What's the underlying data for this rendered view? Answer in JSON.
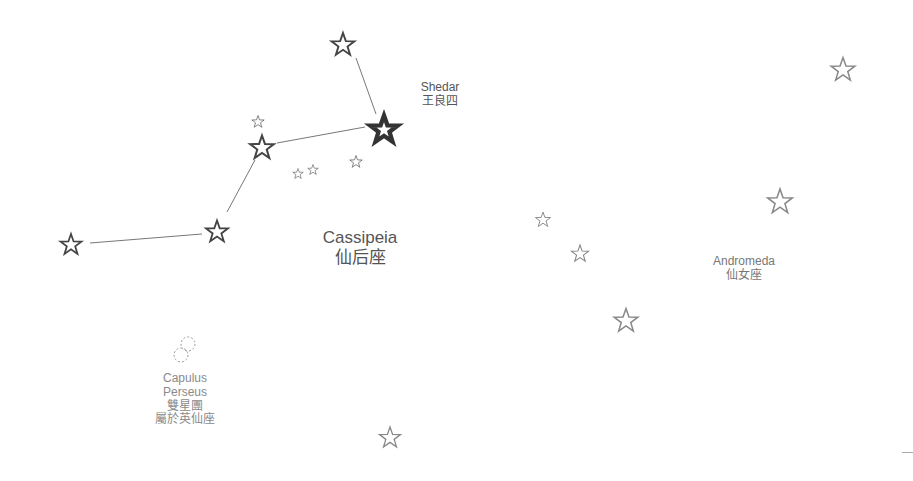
{
  "constellations": {
    "cassiopeia": {
      "name_en": "Cassipeia",
      "name_zh": "仙后座"
    },
    "andromeda": {
      "name_en": "Andromeda",
      "name_zh": "仙女座"
    }
  },
  "stars": {
    "shedar": {
      "name_en": "Shedar",
      "name_zh": "王良四"
    }
  },
  "clusters": {
    "capulus": {
      "line1": "Capulus",
      "line2": "Perseus",
      "line3": "雙星團",
      "line4": "屬於英仙座"
    }
  },
  "colors": {
    "line": "#777777",
    "star_dark": "#444444",
    "star_light": "#999999",
    "label": "#555555"
  }
}
